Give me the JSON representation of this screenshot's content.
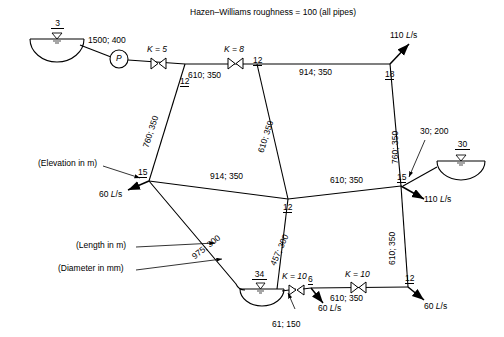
{
  "diagram": {
    "title": "Hazen–Williams roughness = 100 (all pipes)",
    "legend": {
      "elevation": "(Elevation in m)",
      "length": "(Length in m)",
      "diameter": "(Diameter in mm)"
    },
    "pump_label": "P",
    "reservoirs": [
      {
        "name": "reservoir-left",
        "elevation": "3"
      },
      {
        "name": "reservoir-right",
        "elevation": "30"
      },
      {
        "name": "reservoir-bottom",
        "elevation": "34"
      }
    ],
    "nodes": [
      {
        "id": "node-12-top",
        "label": "12"
      },
      {
        "id": "node-12-upper-right",
        "label": "12"
      },
      {
        "id": "node-18",
        "label": "18"
      },
      {
        "id": "node-15-left",
        "label": "15"
      },
      {
        "id": "node-15-right",
        "label": "15"
      },
      {
        "id": "node-12-middle",
        "label": "12"
      },
      {
        "id": "node-6",
        "label": "6"
      },
      {
        "id": "node-12-bottom-right",
        "label": "12"
      }
    ],
    "pipes": [
      {
        "id": "pipe-pump-suction",
        "label": "1500; 400"
      },
      {
        "id": "pipe-top-left",
        "label": "610; 350"
      },
      {
        "id": "pipe-top-right",
        "label": "914; 350"
      },
      {
        "id": "pipe-left-vertical",
        "label": "760; 350"
      },
      {
        "id": "pipe-center-diagonal",
        "label": "610; 350"
      },
      {
        "id": "pipe-right-upper-vertical",
        "label": "760; 350"
      },
      {
        "id": "pipe-middle-left",
        "label": "914; 350"
      },
      {
        "id": "pipe-middle-right",
        "label": "610; 350"
      },
      {
        "id": "pipe-lower-center-diagonal",
        "label": "457; 300"
      },
      {
        "id": "pipe-right-lower-vertical",
        "label": "610; 350"
      },
      {
        "id": "pipe-bottom-left-diagonal",
        "label": "975; 300"
      },
      {
        "id": "pipe-bottom",
        "label": "610; 350"
      },
      {
        "id": "pipe-reservoir-bottom",
        "label": "61; 150"
      },
      {
        "id": "pipe-reservoir-right",
        "label": "30; 200"
      }
    ],
    "valves": [
      {
        "id": "valve-k5",
        "label": "K = 5"
      },
      {
        "id": "valve-k8",
        "label": "K = 8"
      },
      {
        "id": "valve-k10-left",
        "label": "K = 10"
      },
      {
        "id": "valve-k10-right",
        "label": "K = 10"
      }
    ],
    "demands": [
      {
        "id": "demand-node-18",
        "label": "110 L/s"
      },
      {
        "id": "demand-node-15-left",
        "label": "60 L/s"
      },
      {
        "id": "demand-node-15-right",
        "label": "110 L/s"
      },
      {
        "id": "demand-node-6",
        "label": "60 L/s"
      },
      {
        "id": "demand-node-12-bottom-right",
        "label": "60 L/s"
      }
    ]
  }
}
